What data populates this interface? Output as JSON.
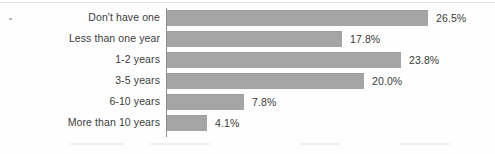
{
  "chart_data": {
    "type": "bar",
    "orientation": "horizontal",
    "title": "",
    "subtitle": "",
    "xlabel": "",
    "ylabel": "",
    "categories": [
      "Don't have one",
      "Less than one year",
      "1-2 years",
      "3-5 years",
      "6-10 years",
      "More than 10 years"
    ],
    "values": [
      26.5,
      17.8,
      23.8,
      20.0,
      7.8,
      4.1
    ],
    "value_labels": [
      "26.5%",
      "17.8%",
      "23.8%",
      "20.0%",
      "7.8%",
      "4.1%"
    ],
    "value_suffix": "%",
    "xlim": [
      0,
      26.5
    ],
    "grid": false,
    "legend": false,
    "legend_position": "none",
    "bar_color": "#a5a5a5",
    "axis_color": "#8d8d8d",
    "text_color": "#3c3c3c"
  },
  "layout": {
    "pixels_per_percent": 9.85,
    "bar_origin_x": 167,
    "row_pitch": 21,
    "bar_height": 15
  }
}
